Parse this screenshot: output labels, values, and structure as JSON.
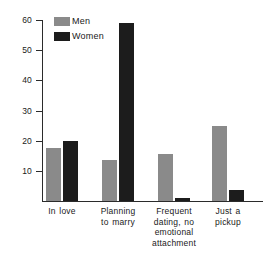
{
  "chart_data": {
    "type": "bar",
    "title": "",
    "subtitle": "",
    "xlabel": "",
    "ylabel": "",
    "categories": [
      "In love",
      "Planning to marry",
      "Frequent dating, no emotional attachment",
      "Just a pickup"
    ],
    "category_lines": [
      [
        "In love"
      ],
      [
        "Planning",
        "to marry"
      ],
      [
        "Frequent",
        "dating, no",
        "emotional",
        "attachment"
      ],
      [
        "Just a",
        "pickup"
      ]
    ],
    "series": [
      {
        "name": "Men",
        "color": "#8a8a8a",
        "values": [
          17.5,
          13.5,
          15.5,
          25.0
        ]
      },
      {
        "name": "Women",
        "color": "#1c1c1c",
        "values": [
          20.0,
          59.0,
          1.0,
          3.5
        ]
      }
    ],
    "legend": {
      "position": "top-left",
      "entries": [
        {
          "label": "Men",
          "color": "#8a8a8a"
        },
        {
          "label": "Women",
          "color": "#1c1c1c"
        }
      ]
    },
    "ylim": [
      0,
      60
    ],
    "yticks": [
      10,
      20,
      30,
      40,
      50,
      60
    ],
    "ytick_labels": [
      "10",
      "20",
      "30",
      "40",
      "50",
      "60"
    ],
    "grid": false,
    "axis_color": "#2b2b2b",
    "background": "#ffffff"
  }
}
